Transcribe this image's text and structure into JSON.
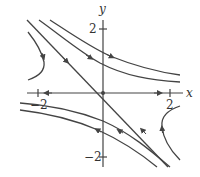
{
  "diagram": {
    "type": "phase-portrait",
    "axes": {
      "x_label": "x",
      "y_label": "y",
      "x_ticks": [
        {
          "value": -2,
          "label": "−2"
        },
        {
          "value": 2,
          "label": "2"
        }
      ],
      "y_ticks": [
        {
          "value": 2,
          "label": "2"
        },
        {
          "value": -2,
          "label": "−2"
        }
      ]
    },
    "equilibrium": {
      "x": 0,
      "y": 0,
      "kind": "saddle"
    },
    "eigenlines": [
      {
        "direction": "x-axis",
        "flow": "away from origin"
      },
      {
        "direction": "y = -x",
        "flow": "toward origin"
      }
    ],
    "trajectories": [
      {
        "name": "upper-right-1",
        "flow": "rightward"
      },
      {
        "name": "upper-right-2",
        "flow": "rightward"
      },
      {
        "name": "lower-left-1",
        "flow": "leftward"
      },
      {
        "name": "lower-left-2",
        "flow": "leftward"
      },
      {
        "name": "left-hyperbola",
        "flow": "downward"
      },
      {
        "name": "right-hyperbola",
        "flow": "upward"
      }
    ],
    "colors": {
      "stroke": "#444444",
      "background": "#ffffff"
    }
  }
}
